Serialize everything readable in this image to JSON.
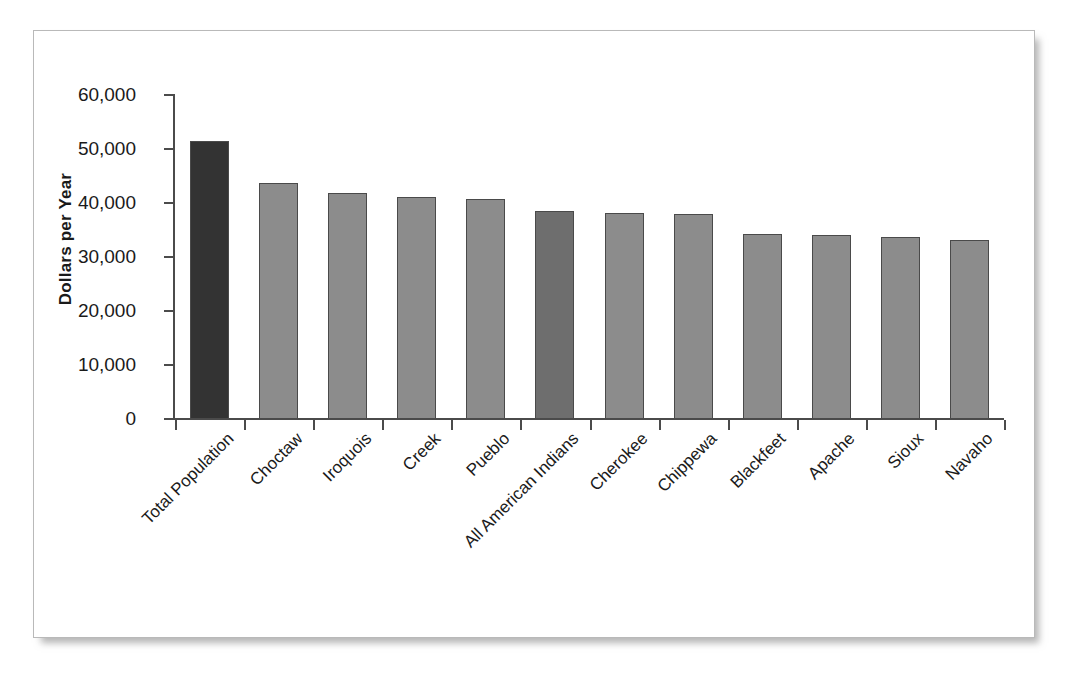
{
  "chart_data": {
    "type": "bar",
    "title": "",
    "xlabel": "",
    "ylabel": "Dollars per Year",
    "ylim": [
      0,
      60000
    ],
    "grid": false,
    "legend": "none",
    "ytick_labels": [
      "60,000",
      "50,000",
      "40,000",
      "30,000",
      "20,000",
      "10,000",
      "0"
    ],
    "ytick_values": [
      60000,
      50000,
      40000,
      30000,
      20000,
      10000,
      0
    ],
    "categories": [
      "Total Population",
      "Choctaw",
      "Iroquois",
      "Creek",
      "Pueblo",
      "All American Indians",
      "Cherokee",
      "Chippewa",
      "Blackfeet",
      "Apache",
      "Sioux",
      "Navaho"
    ],
    "values": [
      51500,
      43700,
      41800,
      41100,
      40800,
      38600,
      38200,
      38000,
      34200,
      34000,
      33700,
      33200
    ],
    "bar_styles": [
      "highlight-dark",
      "normal",
      "normal",
      "normal",
      "normal",
      "highlight-mid",
      "normal",
      "normal",
      "normal",
      "normal",
      "normal",
      "normal"
    ]
  },
  "colors": {
    "bar_normal": "#8c8c8c",
    "bar_highlight_dark": "#333333",
    "bar_highlight_mid": "#6e6e6e",
    "bar_border": "#4a4a4a",
    "axis": "#4b4b4b",
    "text": "#1a1a1a",
    "frame_border": "#b9b9b9",
    "background": "#ffffff"
  }
}
